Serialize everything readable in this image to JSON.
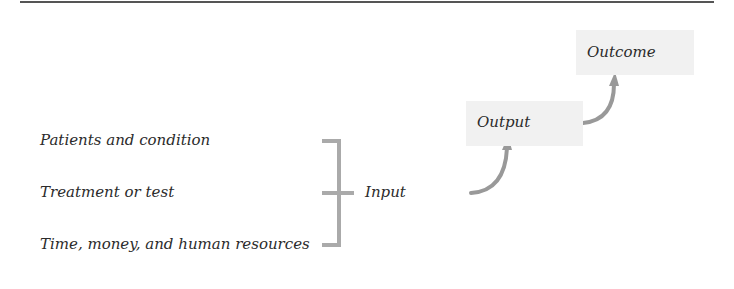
{
  "diagram": {
    "inputs": [
      "Patients and condition",
      "Treatment or test",
      "Time, money, and human resources"
    ],
    "input_label": "Input",
    "output_label": "Output",
    "outcome_label": "Outcome",
    "colors": {
      "connector": "#aaaaaa",
      "box_fill": "#f1f1f1",
      "text": "#2b2b2b",
      "rule": "#555555"
    }
  }
}
